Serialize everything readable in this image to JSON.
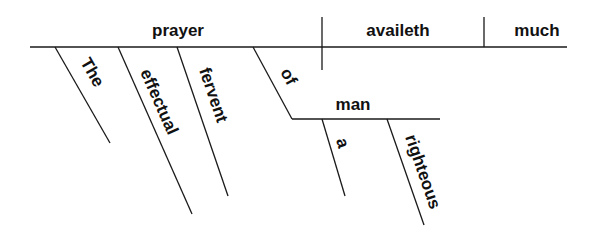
{
  "diagram": {
    "type": "sentence-diagram",
    "sentence": "The effectual fervent prayer of a righteous man availeth much",
    "colors": {
      "line": "#1a1a1a",
      "text": "#111111",
      "background": "#ffffff"
    },
    "baseline": {
      "subject": "prayer",
      "verb": "availeth",
      "modifier": "much"
    },
    "modifiers": {
      "the": "The",
      "effectual": "effectual",
      "fervent": "fervent",
      "preposition": "of",
      "object_of_preposition": "man",
      "a": "a",
      "righteous": "righteous"
    }
  }
}
